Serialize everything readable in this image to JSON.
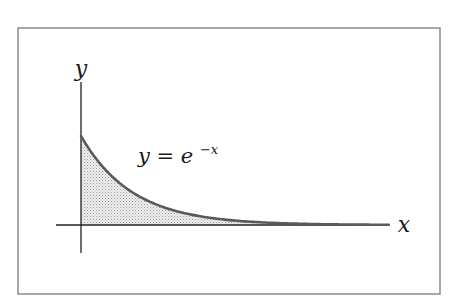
{
  "figure": {
    "frame": {
      "x": 18,
      "y": 28,
      "width": 422,
      "height": 266,
      "stroke": "#8a8a8a"
    },
    "axes": {
      "origin_px": [
        81,
        225
      ],
      "x_axis": {
        "from_px": 56,
        "to_px": 389,
        "label": "x",
        "label_pos": [
          404,
          232
        ]
      },
      "y_axis": {
        "from_px": 82,
        "to_px": 253,
        "label": "y",
        "label_pos": [
          81,
          76
        ]
      },
      "color": "#222222"
    },
    "curve": {
      "equation_label_parts": {
        "lhs": "y = e",
        "exponent": "−x"
      },
      "label_pos": [
        138,
        163
      ],
      "function": "exp(-x)",
      "x_range": [
        0,
        6.0
      ],
      "px_per_unit_x": 51.3,
      "px_per_unit_y": 89,
      "stroke": "#5a5a5a",
      "stroke_width": 2.6,
      "fill": "#d9d9d9",
      "fill_style": "stippled"
    }
  },
  "chart_data": {
    "type": "area",
    "title": "",
    "annotation": "y = e^{-x}",
    "xlabel": "x",
    "ylabel": "y",
    "series": [
      {
        "name": "y = e^{-x}",
        "x": [
          0,
          0.5,
          1,
          1.5,
          2,
          2.5,
          3,
          3.5,
          4,
          4.5,
          5,
          5.5,
          6
        ],
        "values": [
          1.0,
          0.607,
          0.368,
          0.223,
          0.135,
          0.082,
          0.05,
          0.03,
          0.018,
          0.011,
          0.007,
          0.004,
          0.002
        ]
      }
    ],
    "shaded_region": "area under curve from x=0 to right edge",
    "xlim": [
      -0.5,
      6.5
    ],
    "ylim": [
      -0.3,
      1.6
    ],
    "grid": false,
    "legend": "none",
    "ticks": "none"
  }
}
